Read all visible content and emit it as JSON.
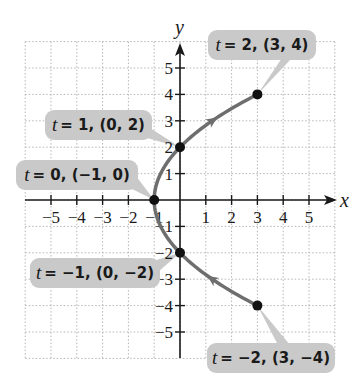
{
  "chart_data": {
    "type": "line",
    "title": "",
    "xlabel": "x",
    "ylabel": "y",
    "xlim": [
      -6,
      6
    ],
    "ylim": [
      -6,
      6
    ],
    "grid": true,
    "x_ticks": [
      -5,
      -4,
      -3,
      -2,
      -1,
      1,
      2,
      3,
      4,
      5
    ],
    "y_ticks": [
      -5,
      -4,
      -3,
      -2,
      -1,
      1,
      2,
      3,
      4,
      5
    ],
    "x_tick_labels": [
      "−5",
      "−4",
      "−3",
      "−2",
      "−1",
      "1",
      "2",
      "3",
      "4",
      "5"
    ],
    "y_tick_labels": [
      "−5",
      "−4",
      "−3",
      "−2",
      "−1",
      "1",
      "2",
      "3",
      "4",
      "5"
    ],
    "curve": {
      "description": "parametric curve x = t^2 - 1, y = 2t, for -2 <= t <= 2, arrows indicate direction of increasing t",
      "t_range": [
        -2,
        2
      ],
      "color": "#6e6e6e"
    },
    "points": [
      {
        "t": -2,
        "x": 3,
        "y": -4,
        "label": "t = −2, (3, −4)"
      },
      {
        "t": -1,
        "x": 0,
        "y": -2,
        "label": "t = −1, (0, −2)"
      },
      {
        "t": 0,
        "x": -1,
        "y": 0,
        "label": "t = 0, (−1, 0)"
      },
      {
        "t": 1,
        "x": 0,
        "y": 2,
        "label": "t = 1, (0, 2)"
      },
      {
        "t": 2,
        "x": 3,
        "y": 4,
        "label": "t = 2, (3, 4)"
      }
    ],
    "annotations": [
      {
        "t_text": "t",
        "rest": "= −2, (3, −4)"
      },
      {
        "t_text": "t",
        "rest": "= −1, (0, −2)"
      },
      {
        "t_text": "t",
        "rest": "= 0, (−1, 0)"
      },
      {
        "t_text": "t",
        "rest": "= 1, (0, 2)"
      },
      {
        "t_text": "t",
        "rest": "= 2, (3, 4)"
      }
    ],
    "colors": {
      "curve": "#6e6e6e",
      "point": "#111111",
      "callout_bg": "#c9c9c9",
      "grid": "#b5b5b5",
      "axis": "#1a1a1a"
    }
  }
}
